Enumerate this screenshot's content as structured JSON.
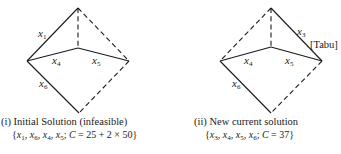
{
  "panels": [
    {
      "id": "i",
      "title": "(i) Initial Solution (infeasible)",
      "formula": {
        "open": "{",
        "vars": [
          {
            "name": "x",
            "sub": "1"
          },
          {
            "name": "x",
            "sub": "6"
          },
          {
            "name": "x",
            "sub": "4"
          },
          {
            "name": "x",
            "sub": "5"
          }
        ],
        "cost_label": "C",
        "cost_value": " = 25 + 2 × 50",
        "close": "}"
      },
      "edge_labels": {
        "e1": {
          "name": "x",
          "sub": "1"
        },
        "e4": {
          "name": "x",
          "sub": "4"
        },
        "e5": {
          "name": "x",
          "sub": "5"
        },
        "e6": {
          "name": "x",
          "sub": "6"
        }
      },
      "solid_edges": [
        "top-left (x1)",
        "left-center (x4)",
        "center-right (x5)",
        "left-bottom (x6)"
      ],
      "dashed_edges": [
        "top-center",
        "top-right",
        "right-bottom"
      ]
    },
    {
      "id": "ii",
      "title": "(ii) New current solution",
      "formula": {
        "open": "{",
        "vars": [
          {
            "name": "x",
            "sub": "3"
          },
          {
            "name": "x",
            "sub": "4"
          },
          {
            "name": "x",
            "sub": "5"
          },
          {
            "name": "x",
            "sub": "6"
          }
        ],
        "cost_label": "C",
        "cost_value": " = 37",
        "close": "}"
      },
      "edge_labels": {
        "e3": {
          "name": "x",
          "sub": "3"
        },
        "e4": {
          "name": "x",
          "sub": "4"
        },
        "e5": {
          "name": "x",
          "sub": "5"
        },
        "e6": {
          "name": "x",
          "sub": "6"
        }
      },
      "annotation": "[Tabu]",
      "solid_edges": [
        "top-right (x3)",
        "left-center (x4)",
        "center-right (x5)",
        "left-bottom (x6)"
      ],
      "dashed_edges": [
        "top-center",
        "top-left",
        "right-bottom"
      ]
    }
  ],
  "separator": ", ",
  "semicolon": "; "
}
